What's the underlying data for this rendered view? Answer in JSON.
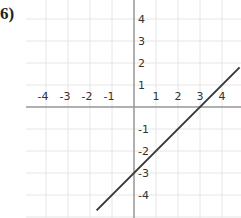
{
  "problem_label": "6)",
  "chart_data": {
    "type": "line",
    "title": "",
    "xlabel": "",
    "ylabel": "",
    "xlim": [
      -5,
      5
    ],
    "ylim": [
      -5,
      5
    ],
    "grid": true,
    "x_ticks": [
      "-4",
      "-3",
      "-2",
      "-1",
      "1",
      "2",
      "3",
      "4"
    ],
    "y_ticks": [
      "4",
      "3",
      "2",
      "1",
      "-1",
      "-2",
      "-3",
      "-4"
    ],
    "series": [
      {
        "name": "y = x - 3",
        "equation": "y = x - 3",
        "slope": 1,
        "intercept": -3,
        "points": [
          [
            -1.7,
            -4.7
          ],
          [
            0,
            -3
          ],
          [
            3,
            0
          ],
          [
            4.8,
            1.8
          ]
        ]
      }
    ],
    "colors": {
      "line": "#3a3a3a",
      "grid": "#e6e6e6",
      "axis": "#9a9a9a"
    }
  }
}
